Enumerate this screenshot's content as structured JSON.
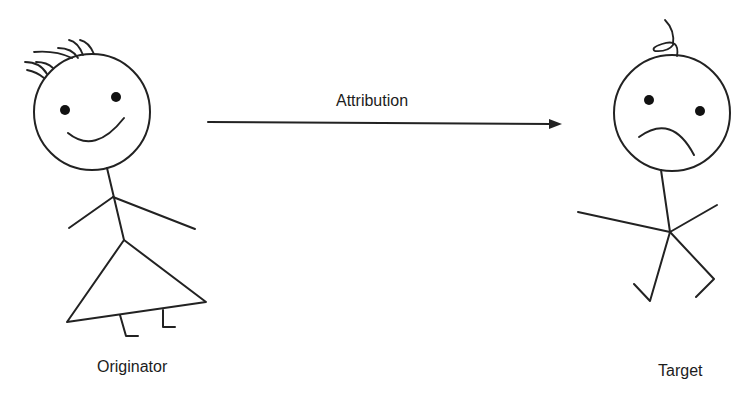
{
  "diagram": {
    "arrow": {
      "label": "Attribution",
      "from": "originator",
      "to": "target"
    },
    "originator": {
      "label": "Originator",
      "expression": "smiling"
    },
    "target": {
      "label": "Target",
      "expression": "frowning"
    },
    "colors": {
      "stroke": "#222222",
      "background": "#ffffff"
    }
  }
}
